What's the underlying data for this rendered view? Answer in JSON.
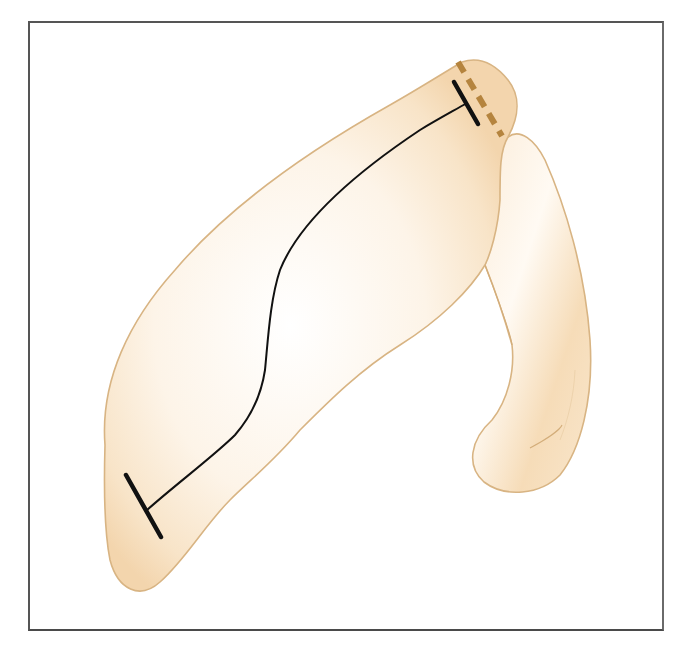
{
  "figure": {
    "colors": {
      "frame": "#555555",
      "shape_fill": "#fbeedd",
      "shape_fill_shade": "#f4d9b4",
      "shape_outline": "#d8b483",
      "measure_line": "#111111",
      "dashed_line": "#b5843e",
      "background": "#ffffff"
    },
    "elements": {
      "main_shape": "large elongated beige body, diagonal lower-left to upper-right",
      "side_lobe": "narrow curved hook-shaped beige lobe on the right",
      "measurement_line": "thin black curved line between two T-bar markers",
      "dashed_marker": "brown dashed line at the upper-right junction"
    }
  },
  "caption": {
    "text": ""
  }
}
